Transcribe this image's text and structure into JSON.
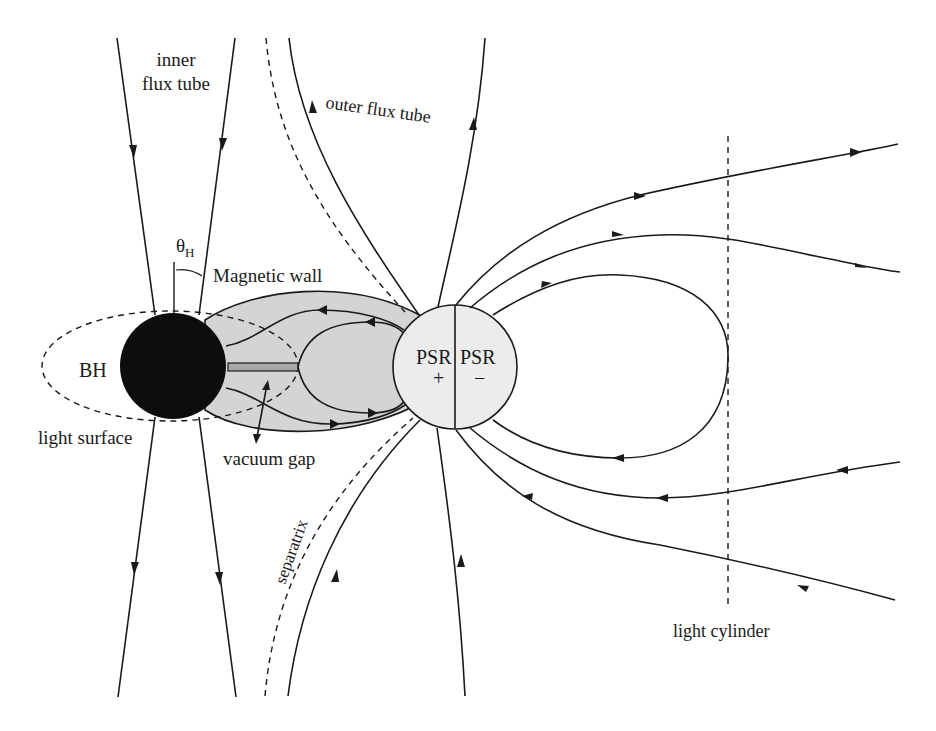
{
  "figure": {
    "type": "schematic",
    "colors": {
      "background": "#ffffff",
      "ink": "#1a1a1a",
      "black_hole": "#0d0d0d",
      "magnetic_wall_fill": "#d4d4d4",
      "pulsar_fill": "#ececec",
      "vacuum_gap_fill": "#a8a8a8"
    }
  },
  "labels": {
    "inner_flux_tube_line1": "inner",
    "inner_flux_tube_line2": "flux tube",
    "outer_flux_tube": "outer  flux  tube",
    "theta": "θ",
    "theta_sub": "H",
    "magnetic_wall": "Magnetic wall",
    "bh": "BH",
    "light_surface": "light surface",
    "vacuum_gap": "vacuum gap",
    "psr_left": "PSR",
    "psr_left_sign": "+",
    "psr_right": "PSR",
    "psr_right_sign": "−",
    "separatrix": "separatrix",
    "light_cylinder": "light cylinder"
  },
  "components": [
    {
      "name": "black-hole",
      "label": "BH"
    },
    {
      "name": "pulsar",
      "label": "PSR",
      "hemispheres": [
        "+",
        "−"
      ]
    },
    {
      "name": "light-surface",
      "style": "dashed ellipse"
    },
    {
      "name": "magnetic-wall",
      "style": "grey shaded region"
    },
    {
      "name": "vacuum-gap",
      "style": "grey bar"
    },
    {
      "name": "inner-flux-tube",
      "lines": 4
    },
    {
      "name": "outer-flux-tube",
      "lines": 4
    },
    {
      "name": "separatrix",
      "style": "dashed curves"
    },
    {
      "name": "light-cylinder",
      "style": "vertical dashed line"
    }
  ]
}
